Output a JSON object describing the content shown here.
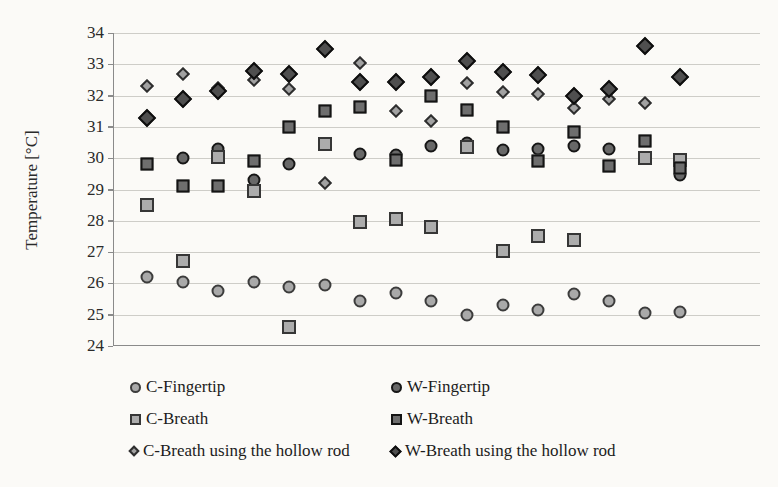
{
  "figure": {
    "background": "#fbfaf7",
    "y_axis": {
      "title": "Temperature [°C]",
      "min": 24,
      "max": 34,
      "tick_step": 1,
      "ticks": [
        34,
        33,
        32,
        31,
        30,
        29,
        28,
        27,
        26,
        25,
        24
      ]
    },
    "x_axis": {
      "title": "",
      "tick_labels_visible": false
    },
    "legend": {
      "position": "bottom-two-columns",
      "left_column": [
        {
          "series_key": "c_fingertip",
          "label": "C-Fingertip"
        },
        {
          "series_key": "c_breath",
          "label": "C-Breath"
        },
        {
          "series_key": "c_breath_rod",
          "label": "C-Breath using the hollow rod"
        }
      ],
      "right_column": [
        {
          "series_key": "w_fingertip",
          "label": "W-Fingertip"
        },
        {
          "series_key": "w_breath",
          "label": "W-Breath"
        },
        {
          "series_key": "w_breath_rod",
          "label": "W-Breath using the hollow rod"
        }
      ]
    },
    "colors": {
      "light_fill": "#a9a9a9",
      "light_border": "#3c3c3c",
      "dark_fill": "#5f5f5f",
      "dark_border": "#141414",
      "gridline": "#c6c4c0",
      "axis": "#8a8a8a"
    }
  },
  "chart_data": {
    "type": "scatter",
    "title": "",
    "xlabel": "",
    "ylabel": "Temperature [°C]",
    "ylim": [
      24,
      34
    ],
    "grid": "horizontal",
    "legend_position": "bottom",
    "x": [
      1,
      2,
      3,
      4,
      5,
      6,
      7,
      8,
      9,
      10,
      11,
      12,
      13,
      14,
      15,
      16
    ],
    "series": [
      {
        "name": "C-Fingertip",
        "key": "c_fingertip",
        "marker": "circle",
        "shade": "light",
        "values": [
          26.2,
          26.05,
          25.75,
          26.05,
          25.9,
          25.95,
          25.45,
          25.7,
          25.45,
          25.0,
          25.3,
          25.15,
          25.65,
          25.45,
          25.05,
          25.1
        ]
      },
      {
        "name": "W-Fingertip",
        "key": "w_fingertip",
        "marker": "circle",
        "shade": "dark",
        "values": [
          null,
          30.0,
          30.3,
          29.3,
          29.8,
          null,
          30.15,
          30.1,
          30.4,
          30.5,
          30.25,
          30.3,
          30.4,
          30.3,
          null,
          29.45
        ]
      },
      {
        "name": "C-Breath",
        "key": "c_breath",
        "marker": "square",
        "shade": "light",
        "values": [
          28.5,
          26.7,
          30.05,
          28.95,
          24.6,
          30.45,
          27.95,
          28.05,
          27.8,
          30.35,
          27.05,
          27.5,
          27.4,
          null,
          30.0,
          29.95
        ]
      },
      {
        "name": "W-Breath",
        "key": "w_breath",
        "marker": "square",
        "shade": "dark",
        "values": [
          29.8,
          29.1,
          29.1,
          29.9,
          31.0,
          31.5,
          31.65,
          29.95,
          32.0,
          31.55,
          31.0,
          29.9,
          30.85,
          29.75,
          30.55,
          29.7
        ]
      },
      {
        "name": "C-Breath using the hollow rod",
        "key": "c_breath_rod",
        "marker": "diamond",
        "shade": "light",
        "values": [
          32.3,
          32.7,
          32.25,
          32.5,
          32.2,
          29.2,
          33.05,
          31.5,
          31.2,
          32.4,
          32.1,
          32.05,
          31.6,
          31.9,
          31.75,
          null
        ]
      },
      {
        "name": "W-Breath using the hollow rod",
        "key": "w_breath_rod",
        "marker": "diamond",
        "shade": "dark",
        "values": [
          31.3,
          31.9,
          32.15,
          32.8,
          32.7,
          33.5,
          32.45,
          32.45,
          32.6,
          33.1,
          32.75,
          32.65,
          32.0,
          32.2,
          33.6,
          32.6
        ]
      }
    ]
  }
}
